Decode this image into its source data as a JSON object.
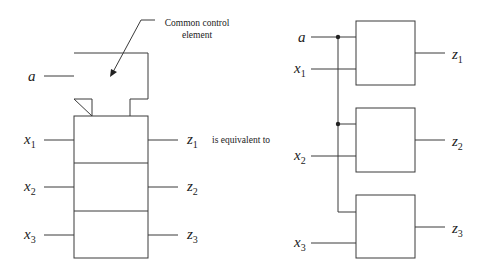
{
  "left_diagram": {
    "callout": {
      "line1": "Common control",
      "line2": "element"
    },
    "control_input": {
      "name": "a"
    },
    "inputs": [
      {
        "name": "x",
        "sub": "1"
      },
      {
        "name": "x",
        "sub": "2"
      },
      {
        "name": "x",
        "sub": "3"
      }
    ],
    "outputs": [
      {
        "name": "z",
        "sub": "1"
      },
      {
        "name": "z",
        "sub": "2"
      },
      {
        "name": "z",
        "sub": "3"
      }
    ]
  },
  "connector_text": "is equivalent to",
  "right_diagram": {
    "control_input": {
      "name": "a"
    },
    "inputs": [
      {
        "name": "x",
        "sub": "1"
      },
      {
        "name": "x",
        "sub": "2"
      },
      {
        "name": "x",
        "sub": "3"
      }
    ],
    "outputs": [
      {
        "name": "z",
        "sub": "1"
      },
      {
        "name": "z",
        "sub": "2"
      },
      {
        "name": "z",
        "sub": "3"
      }
    ]
  }
}
